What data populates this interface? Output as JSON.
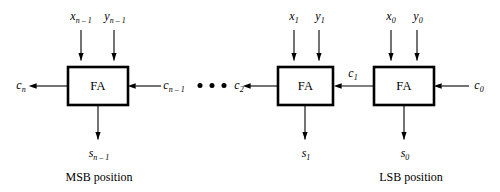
{
  "figure": {
    "background_color": "#ffffff",
    "line_color": "#000000",
    "box_fill": "#ffffff"
  },
  "blocks": [
    {
      "id": "msb",
      "label": "FA",
      "caption": "MSB position"
    },
    {
      "id": "bit1",
      "label": "FA",
      "caption": ""
    },
    {
      "id": "lsb",
      "label": "FA",
      "caption": "LSB position"
    }
  ],
  "inputs": {
    "msb": {
      "x": "x",
      "x_sub": "n – 1",
      "y": "y",
      "y_sub": "n – 1"
    },
    "bit1": {
      "x": "x",
      "x_sub": "1",
      "y": "y",
      "y_sub": "1"
    },
    "lsb": {
      "x": "x",
      "x_sub": "0",
      "y": "y",
      "y_sub": "0"
    }
  },
  "sums": {
    "msb": {
      "s": "s",
      "s_sub": "n – 1"
    },
    "bit1": {
      "s": "s",
      "s_sub": "1"
    },
    "lsb": {
      "s": "s",
      "s_sub": "0"
    }
  },
  "carries": {
    "out_msb": {
      "c": "c",
      "c_sub": "n"
    },
    "in_msb": {
      "c": "c",
      "c_sub": "n – 1"
    },
    "mid_right": {
      "c": "c",
      "c_sub": "2"
    },
    "bit1_in": {
      "c": "c",
      "c_sub": "1"
    },
    "lsb_in": {
      "c": "c",
      "c_sub": "0"
    }
  },
  "ellipsis": {
    "dots": 3,
    "label": "• • •"
  },
  "captions": {
    "msb": "MSB position",
    "lsb": "LSB position"
  }
}
